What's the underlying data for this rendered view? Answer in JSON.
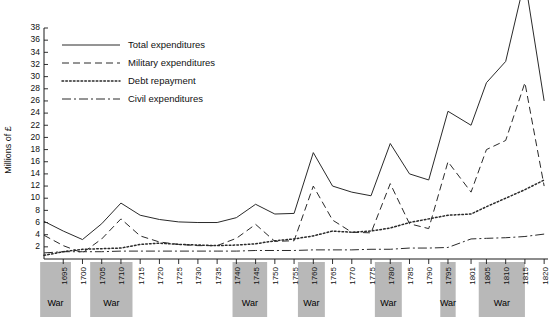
{
  "chart_data": {
    "type": "line",
    "title": "",
    "xlabel": "",
    "ylabel": "Millions of £",
    "ylim": [
      0,
      38
    ],
    "xlim": [
      1690,
      1821
    ],
    "grid": false,
    "legend_position": "top-left",
    "y_ticks": [
      2,
      4,
      6,
      8,
      10,
      12,
      14,
      16,
      18,
      20,
      22,
      24,
      26,
      28,
      30,
      32,
      34,
      36,
      38
    ],
    "x_ticks": [
      1695,
      1700,
      1705,
      1710,
      1715,
      1720,
      1725,
      1730,
      1735,
      1740,
      1745,
      1750,
      1755,
      1760,
      1765,
      1770,
      1775,
      1780,
      1785,
      1790,
      1795,
      1801,
      1805,
      1810,
      1815,
      1820
    ],
    "x": [
      1690,
      1695,
      1700,
      1705,
      1710,
      1715,
      1720,
      1725,
      1730,
      1735,
      1740,
      1745,
      1750,
      1755,
      1760,
      1765,
      1770,
      1775,
      1780,
      1785,
      1790,
      1795,
      1801,
      1805,
      1810,
      1815,
      1820
    ],
    "series": [
      {
        "name": "Total expenditures",
        "style": "solid",
        "values": [
          6.2,
          4.6,
          3.2,
          5.8,
          9.2,
          7.2,
          6.5,
          6.1,
          6.0,
          6.0,
          6.8,
          9.0,
          7.4,
          7.5,
          17.5,
          12.0,
          11.0,
          10.4,
          19.0,
          14.0,
          13.0,
          24.3,
          22.0,
          29.0,
          32.5,
          46.0,
          26.0
        ]
      },
      {
        "name": "Military expenditures",
        "style": "dashed",
        "values": [
          3.9,
          2.2,
          1.0,
          3.3,
          6.6,
          3.8,
          2.8,
          2.4,
          2.2,
          2.2,
          3.4,
          5.7,
          2.9,
          3.0,
          12.0,
          6.4,
          4.4,
          4.3,
          12.4,
          5.8,
          5.0,
          16.0,
          11.0,
          18.0,
          19.5,
          29.0,
          12.0
        ]
      },
      {
        "name": "Debt repayment",
        "style": "dotted",
        "values": [
          0.6,
          1.2,
          1.6,
          1.7,
          1.8,
          2.4,
          2.6,
          2.4,
          2.3,
          2.2,
          2.3,
          2.5,
          3.0,
          3.3,
          3.8,
          4.6,
          4.4,
          4.6,
          5.1,
          6.0,
          6.6,
          7.2,
          7.4,
          8.6,
          10.0,
          11.4,
          13.0
        ]
      },
      {
        "name": "Civil expenditures",
        "style": "dashdot",
        "values": [
          1.0,
          1.2,
          1.2,
          1.2,
          1.3,
          1.3,
          1.3,
          1.3,
          1.3,
          1.3,
          1.3,
          1.4,
          1.4,
          1.4,
          1.5,
          1.5,
          1.5,
          1.6,
          1.6,
          1.8,
          1.8,
          1.9,
          3.3,
          3.4,
          3.5,
          3.7,
          4.1
        ]
      }
    ],
    "war_bands": [
      {
        "label": "War",
        "start": 1689,
        "end": 1697
      },
      {
        "label": "War",
        "start": 1702,
        "end": 1713
      },
      {
        "label": "War",
        "start": 1739,
        "end": 1748
      },
      {
        "label": "War",
        "start": 1756,
        "end": 1763
      },
      {
        "label": "War",
        "start": 1776,
        "end": 1783
      },
      {
        "label": "War",
        "start": 1793,
        "end": 1797
      },
      {
        "label": "War",
        "start": 1803,
        "end": 1815
      }
    ]
  },
  "legend": {
    "items": [
      {
        "label": "Total expenditures"
      },
      {
        "label": "Military expenditures"
      },
      {
        "label": "Debt repayment"
      },
      {
        "label": "Civil expenditures"
      }
    ]
  }
}
